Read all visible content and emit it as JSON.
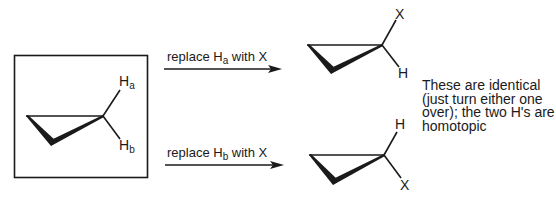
{
  "diagram": {
    "starting_molecule": {
      "name": "cyclopropane",
      "boxed": true,
      "labels": {
        "h_a": {
          "atom": "H",
          "subscript": "a"
        },
        "h_b": {
          "atom": "H",
          "subscript": "b"
        }
      }
    },
    "reactions": [
      {
        "label_prefix": "replace H",
        "label_subscript": "a",
        "label_suffix": " with X",
        "product": {
          "top_label": "X",
          "bottom_label": "H"
        }
      },
      {
        "label_prefix": "replace H",
        "label_subscript": "b",
        "label_suffix": " with X",
        "product": {
          "top_label": "H",
          "bottom_label": "X"
        }
      }
    ],
    "note": {
      "lines": [
        "These are identical",
        "(just turn either one",
        "over); the two H's are",
        "homotopic"
      ]
    },
    "colors": {
      "ink": "#1a1a1a",
      "background": "#ffffff"
    }
  }
}
